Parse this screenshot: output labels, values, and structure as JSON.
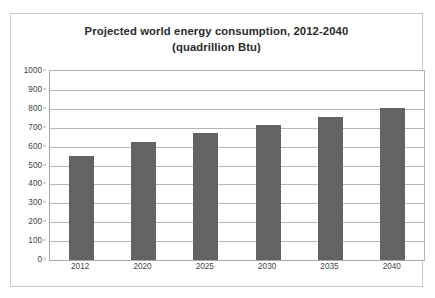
{
  "chart_data": {
    "type": "bar",
    "title": "Projected world energy consumption, 2012-2040 (quadrillion Btu)",
    "title_lines": [
      "Projected world energy consumption, 2012-2040",
      "(quadrillion Btu)"
    ],
    "categories": [
      "2012",
      "2020",
      "2025",
      "2030",
      "2035",
      "2040"
    ],
    "values": [
      550,
      625,
      670,
      713,
      757,
      805
    ],
    "series": [
      {
        "name": "Projected world energy consumption",
        "values": [
          550,
          625,
          670,
          713,
          757,
          805
        ]
      }
    ],
    "xlabel": "",
    "ylabel": "",
    "ylim": [
      0,
      1000
    ],
    "y_ticks": [
      0,
      100,
      200,
      300,
      400,
      500,
      600,
      700,
      800,
      900,
      1000
    ],
    "y_tick_labels": [
      "0",
      "100",
      "200",
      "300",
      "400",
      "500",
      "600",
      "700",
      "800",
      "900",
      "1000"
    ],
    "grid": true,
    "legend": false,
    "legend_position": "none",
    "bar_color": "#636363",
    "gridline_color": "#b6b6b6",
    "axis_color": "#a9a9a9",
    "plot_background": "#ffffff",
    "frame_border_color": "#c8c8c8",
    "title_color": "#2b2b2b",
    "tick_label_color": "#444444"
  }
}
